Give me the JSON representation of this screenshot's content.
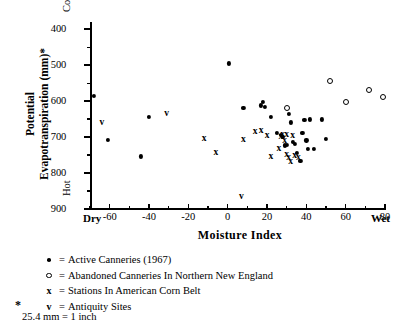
{
  "chart_data": {
    "type": "scatter",
    "title": "",
    "xlabel": "Moisture  Index",
    "ylabel_line1": "Potential",
    "ylabel_line2": "Evapotranspiration (mm)*",
    "xlim": [
      -70,
      80
    ],
    "ylim": [
      900,
      380
    ],
    "y_inverted": true,
    "grid": false,
    "x_ticks": [
      -60,
      -40,
      -20,
      0,
      20,
      40,
      60,
      80
    ],
    "x_minor_ticks": [
      -70,
      -50,
      -30,
      -10,
      10,
      30,
      50,
      70
    ],
    "y_ticks": [
      400,
      500,
      600,
      700,
      800,
      900
    ],
    "y_minor_ticks": [
      450,
      550,
      650,
      750,
      850
    ],
    "axis_end_labels": {
      "x_low": "Dry",
      "x_high": "Wet",
      "y_high": "Cold",
      "y_low": "Hot"
    },
    "legend_position": "below",
    "series": [
      {
        "name": "Active Canneries (1967)",
        "marker": "dot",
        "points": [
          [
            -68,
            585
          ],
          [
            -61,
            708
          ],
          [
            -44,
            754
          ],
          [
            -40,
            645
          ],
          [
            0.5,
            495
          ],
          [
            8,
            620
          ],
          [
            17,
            612
          ],
          [
            18,
            603
          ],
          [
            19,
            615
          ],
          [
            22,
            645
          ],
          [
            25,
            688
          ],
          [
            27,
            693
          ],
          [
            28,
            700
          ],
          [
            29,
            723
          ],
          [
            30,
            721
          ],
          [
            31,
            636
          ],
          [
            32,
            659
          ],
          [
            33,
            713
          ],
          [
            34,
            718
          ],
          [
            35,
            745
          ],
          [
            37,
            766
          ],
          [
            38,
            688
          ],
          [
            39,
            653
          ],
          [
            40,
            709
          ],
          [
            41,
            732
          ],
          [
            42,
            651
          ],
          [
            44,
            733
          ],
          [
            48,
            651
          ],
          [
            50,
            705
          ]
        ]
      },
      {
        "name": "Abandoned Canneries In Northern New England",
        "marker": "open-circle",
        "points": [
          [
            30,
            620
          ],
          [
            52,
            545
          ],
          [
            60,
            603
          ],
          [
            72,
            570
          ],
          [
            79,
            589
          ]
        ]
      },
      {
        "name": "Stations In American Corn Belt",
        "marker": "x",
        "points": [
          [
            -12,
            704
          ],
          [
            -6,
            744
          ],
          [
            8,
            708
          ],
          [
            14,
            687
          ],
          [
            17,
            683
          ],
          [
            20,
            697
          ],
          [
            26,
            732
          ],
          [
            27,
            700
          ],
          [
            28,
            693
          ],
          [
            29,
            712
          ],
          [
            30,
            693
          ],
          [
            30,
            751
          ],
          [
            31,
            757
          ],
          [
            32,
            769
          ],
          [
            33,
            697
          ],
          [
            34,
            752
          ],
          [
            36,
            757
          ],
          [
            22,
            755
          ]
        ]
      },
      {
        "name": "Antiquity Sites",
        "marker": "v",
        "points": [
          [
            -64,
            662
          ],
          [
            -31,
            637
          ],
          [
            7,
            868
          ]
        ]
      }
    ]
  },
  "legend": {
    "items": [
      {
        "key": "dot-marker",
        "eq": "=",
        "label": "Active Canneries (1967)"
      },
      {
        "key": "open-circle-marker",
        "eq": "=",
        "label": "Abandoned Canneries In Northern New England"
      },
      {
        "key": "x-marker",
        "eq": "=",
        "label": " Stations In American Corn Belt"
      },
      {
        "key": "v-marker",
        "eq": "=",
        "label": "Antiquity Sites"
      }
    ]
  },
  "footnote": {
    "star": "*",
    "text": "25.4 mm = 1 inch"
  }
}
